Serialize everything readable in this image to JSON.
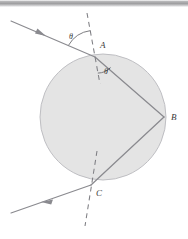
{
  "figure": {
    "background_color": "#ffffff",
    "width": 188,
    "height": 239
  },
  "sphere": {
    "label": "water-drop-circle",
    "center_x": 103,
    "center_y": 117,
    "radius": 63,
    "fill_color": "#e4e4e4",
    "stroke_color": "#b9b9bd"
  },
  "points": [
    {
      "id": "A",
      "label": "A",
      "x": 95,
      "y": 57,
      "label_x": 100,
      "label_y": 48
    },
    {
      "id": "B",
      "label": "B",
      "x": 164,
      "y": 117,
      "label_x": 171,
      "label_y": 120
    },
    {
      "id": "C",
      "label": "C",
      "x": 91,
      "y": 185,
      "label_x": 96,
      "label_y": 196
    }
  ],
  "angles": [
    {
      "id": "theta",
      "label": "θ",
      "label_x": 69,
      "label_y": 39,
      "description": "angle of incidence between incoming ray and normal at A"
    },
    {
      "id": "theta-prime",
      "label": "θ'",
      "label_x": 104,
      "label_y": 74,
      "description": "angle of refraction between normal at A and internal chord AB"
    }
  ],
  "rays": {
    "incident": {
      "name": "incident-ray",
      "from_x": 11,
      "from_y": 21,
      "to_x": 95,
      "to_y": 57,
      "arrow_x": 41,
      "arrow_y": 34
    },
    "chord_ab": {
      "name": "internal-chord-ab",
      "from_x": 95,
      "from_y": 57,
      "to_x": 164,
      "to_y": 117
    },
    "chord_bc": {
      "name": "internal-chord-bc",
      "from_x": 164,
      "from_y": 117,
      "to_x": 91,
      "to_y": 185
    },
    "exit": {
      "name": "exit-ray",
      "from_x": 91,
      "from_y": 185,
      "to_x": 11,
      "to_y": 213,
      "arrow_x": 48,
      "arrow_y": 200
    }
  },
  "normals": {
    "at_a": {
      "name": "normal-line-at-a",
      "from_x": 87,
      "from_y": 13,
      "to_x": 100,
      "to_y": 84
    },
    "at_c": {
      "name": "normal-line-at-c",
      "from_x": 97,
      "from_y": 151,
      "to_x": 85,
      "to_y": 226
    }
  },
  "colors": {
    "line": "#8a8a8f",
    "label": "#3a3a3a",
    "fill": "#e4e4e4"
  }
}
